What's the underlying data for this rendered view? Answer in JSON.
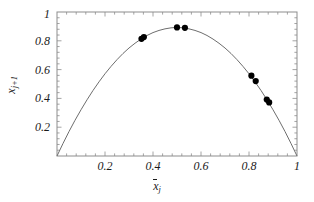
{
  "figure": {
    "background_color": "#ffffff",
    "frame_color": "#808080",
    "curve_color": "#6e6e6e",
    "point_color": "#000000",
    "text_color": "#1a1a1a"
  },
  "axes": {
    "x_title_base": "x",
    "x_title_sub": "j",
    "y_title_base": "x",
    "y_title_sub": "j+1",
    "x_tick_labels": [
      "0.2",
      "0.4",
      "0.6",
      "0.8",
      "1"
    ],
    "x_tick_values": [
      0.2,
      0.4,
      0.6,
      0.8,
      1.0
    ],
    "y_tick_labels": [
      "0.2",
      "0.4",
      "0.6",
      "0.8",
      "1"
    ],
    "y_tick_values": [
      0.2,
      0.4,
      0.6,
      0.8,
      1.0
    ]
  },
  "chart_data": {
    "type": "scatter",
    "title": "",
    "xlabel": "x̄_j",
    "ylabel": "x_j+1",
    "xlim": [
      0.0,
      1.0
    ],
    "ylim": [
      0.0,
      1.0
    ],
    "grid": false,
    "legend": "none",
    "series": [
      {
        "name": "logistic map curve",
        "type": "line",
        "equation": "y = 3.57 x (1 - x)",
        "x": [
          0.0,
          0.025,
          0.05,
          0.075,
          0.1,
          0.125,
          0.15,
          0.175,
          0.2,
          0.225,
          0.25,
          0.275,
          0.3,
          0.325,
          0.35,
          0.375,
          0.4,
          0.425,
          0.45,
          0.475,
          0.5,
          0.525,
          0.55,
          0.575,
          0.6,
          0.625,
          0.65,
          0.675,
          0.7,
          0.725,
          0.75,
          0.775,
          0.8,
          0.825,
          0.85,
          0.875,
          0.9,
          0.925,
          0.95,
          0.975,
          1.0
        ],
        "y": [
          0.0,
          0.087,
          0.17,
          0.248,
          0.321,
          0.39,
          0.455,
          0.515,
          0.571,
          0.622,
          0.669,
          0.712,
          0.75,
          0.783,
          0.812,
          0.837,
          0.857,
          0.872,
          0.883,
          0.89,
          0.893,
          0.89,
          0.883,
          0.872,
          0.857,
          0.837,
          0.812,
          0.783,
          0.75,
          0.712,
          0.669,
          0.622,
          0.571,
          0.515,
          0.455,
          0.39,
          0.321,
          0.248,
          0.17,
          0.087,
          0.0
        ]
      },
      {
        "name": "data points",
        "type": "scatter",
        "marker": "filled-circle",
        "x": [
          0.352,
          0.362,
          0.5,
          0.533,
          0.81,
          0.828,
          0.874,
          0.884
        ],
        "y": [
          0.814,
          0.826,
          0.893,
          0.89,
          0.558,
          0.52,
          0.392,
          0.372
        ]
      }
    ]
  }
}
